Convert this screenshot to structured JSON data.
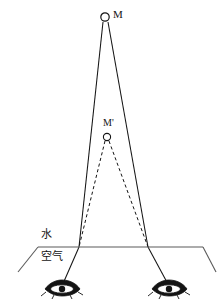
{
  "figure": {
    "kind": "physics-ray-diagram",
    "topic": "refraction at a water-air interface with apparent image",
    "background_color": "#ffffff",
    "ink_color": "#141414",
    "width": 222,
    "height": 301
  },
  "labels": {
    "object_point": "M",
    "image_point": "M'",
    "upper_medium": "水",
    "lower_medium": "空气"
  },
  "points": {
    "object": {
      "name": "M",
      "x": 105,
      "y": 17,
      "radius": 4
    },
    "image": {
      "name": "M'",
      "x": 107,
      "y": 137,
      "radius": 3.6
    },
    "refraction_left": {
      "x": 79,
      "y": 247
    },
    "refraction_right": {
      "x": 148,
      "y": 247
    },
    "eye_left": {
      "x": 62,
      "y": 288
    },
    "eye_right": {
      "x": 169,
      "y": 288
    }
  },
  "interface": {
    "label_top": "水",
    "label_bottom": "空气",
    "line_y": 247,
    "line_x_start": 38,
    "line_x_end": 203,
    "left_edge_x": 18,
    "left_edge_y": 271,
    "right_edge_x": 215,
    "right_edge_y": 271
  },
  "rays": [
    {
      "name": "incident-ray-left",
      "style": "solid",
      "from": "M",
      "to": "refraction_left"
    },
    {
      "name": "incident-ray-right",
      "style": "solid",
      "from": "M",
      "to": "refraction_right"
    },
    {
      "name": "virtual-ray-left",
      "style": "dashed",
      "from": "M'",
      "to": "refraction_left"
    },
    {
      "name": "virtual-ray-right",
      "style": "dashed",
      "from": "M'",
      "to": "refraction_right"
    },
    {
      "name": "refracted-ray-left",
      "style": "solid",
      "from": "refraction_left",
      "to": "eye_left"
    },
    {
      "name": "refracted-ray-right",
      "style": "solid",
      "from": "refraction_right",
      "to": "eye_right"
    }
  ],
  "observers": [
    {
      "name": "eye-left",
      "x": 62,
      "y": 288
    },
    {
      "name": "eye-right",
      "x": 169,
      "y": 288
    }
  ]
}
